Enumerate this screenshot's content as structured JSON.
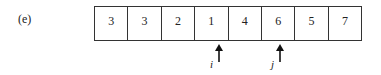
{
  "figure": {
    "label": "(e)",
    "array": [
      "3",
      "3",
      "2",
      "1",
      "4",
      "6",
      "5",
      "7"
    ],
    "pointers": [
      {
        "name": "i",
        "index": 3
      },
      {
        "name": "j",
        "index": 5
      }
    ]
  }
}
